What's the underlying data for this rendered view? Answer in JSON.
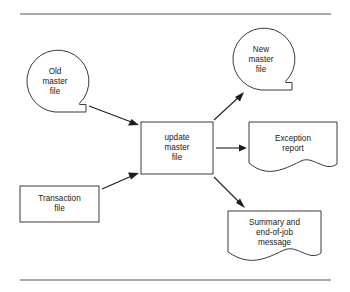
{
  "diagram": {
    "type": "system-flowchart",
    "stroke_color": "#3a3a3a",
    "rule_color": "#8d8d8d",
    "arrow_color": "#1d1d1d",
    "background_color": "#ffffff",
    "top_rule": {
      "x1": 20,
      "y1": 14,
      "x2": 331,
      "y2": 14
    },
    "bottom_rule": {
      "x1": 20,
      "y1": 280,
      "x2": 331,
      "y2": 280
    },
    "nodes": [
      {
        "id": "old-master-file",
        "symbol": "magnetic-tape",
        "lines": [
          "Old",
          "master",
          "file"
        ],
        "cx": 55,
        "cy": 81,
        "r": 31
      },
      {
        "id": "new-master-file",
        "symbol": "magnetic-tape",
        "lines": [
          "New",
          "master",
          "file"
        ],
        "cx": 261,
        "cy": 59,
        "r": 31
      },
      {
        "id": "transaction-file",
        "symbol": "process-rectangle",
        "lines": [
          "Transaction",
          "file"
        ],
        "x": 20,
        "y": 186,
        "w": 79,
        "h": 36
      },
      {
        "id": "update-master-file",
        "symbol": "process-rectangle",
        "lines": [
          "update",
          "master",
          "file"
        ],
        "x": 141,
        "y": 122,
        "w": 72,
        "h": 52
      },
      {
        "id": "exception-report",
        "symbol": "document",
        "lines": [
          "Exception",
          "report"
        ],
        "x": 249,
        "y": 122,
        "w": 88,
        "h": 46
      },
      {
        "id": "summary-message",
        "symbol": "document",
        "lines": [
          "Summary and",
          "end-of-job",
          "message"
        ],
        "x": 228,
        "y": 211,
        "w": 93,
        "h": 50
      }
    ],
    "connectors": [
      {
        "id": "old-to-update",
        "from": "old-master-file",
        "to": "update-master-file",
        "x1": 89,
        "y1": 106,
        "x2": 138,
        "y2": 124
      },
      {
        "id": "transaction-to-update",
        "from": "transaction-file",
        "to": "update-master-file",
        "x1": 102,
        "y1": 188,
        "x2": 138,
        "y2": 173
      },
      {
        "id": "update-to-new",
        "from": "update-master-file",
        "to": "new-master-file",
        "x1": 214,
        "y1": 120,
        "x2": 243,
        "y2": 92
      },
      {
        "id": "update-to-exception",
        "from": "update-master-file",
        "to": "exception-report",
        "x1": 216,
        "y1": 148,
        "x2": 246,
        "y2": 148
      },
      {
        "id": "update-to-summary",
        "from": "update-master-file",
        "to": "summary-message",
        "x1": 214,
        "y1": 177,
        "x2": 244,
        "y2": 207
      }
    ]
  }
}
